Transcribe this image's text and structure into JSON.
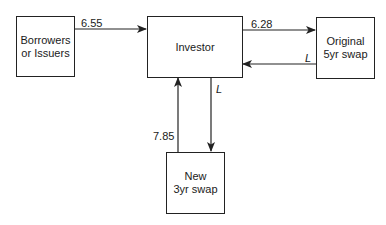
{
  "nodes": {
    "borrowers": {
      "line1": "Borrowers",
      "line2": "or Issuers"
    },
    "investor": {
      "label": "Investor"
    },
    "original": {
      "line1": "Original",
      "line2": "5yr swap"
    },
    "new_swap": {
      "line1": "New",
      "line2": "3yr swap"
    }
  },
  "edges": {
    "borrowers_to_investor": "6.55",
    "investor_to_original": "6.28",
    "original_to_investor": "L",
    "new_to_investor": "7.85",
    "investor_to_new": "L"
  },
  "colors": {
    "stroke": "#222222",
    "text": "#1a1a1a"
  }
}
